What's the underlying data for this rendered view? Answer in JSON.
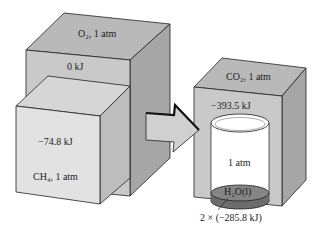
{
  "diagram": {
    "o2_box": {
      "label": "O₂, 1 atm",
      "energy": "0 kJ"
    },
    "ch4_box": {
      "label": "CH₄, 1 atm",
      "energy": "−74.8 kJ"
    },
    "co2_box": {
      "label": "CO₂, 1 atm",
      "energy": "−393.5 kJ"
    },
    "beaker": {
      "label": "1 atm",
      "liquid_label": "H₂O(l)",
      "energy": "2 × (−285.8 kJ)"
    },
    "arrow": "reaction-arrow"
  },
  "colors": {
    "box_front": "#c9c9c9",
    "box_top": "#b8b8b8",
    "box_side": "#a8a8a8",
    "front_light": "#e2e2e2",
    "liquid": "#777777",
    "outline": "#222222"
  }
}
